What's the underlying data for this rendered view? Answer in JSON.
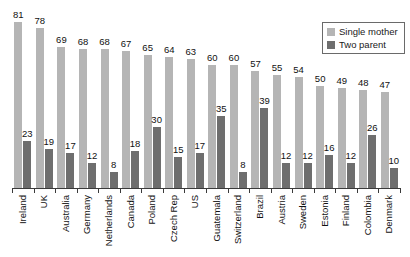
{
  "chart_data": {
    "type": "bar",
    "title": "",
    "subtitle": "",
    "xlabel": "",
    "ylabel": "",
    "ylim": [
      0,
      85
    ],
    "grid": false,
    "legend_position": "top-right",
    "orientation": "vertical",
    "grouping": "grouped",
    "categories": [
      "Ireland",
      "UK",
      "Australia",
      "Germany",
      "Netherlands",
      "Canada",
      "Poland",
      "Czech Rep",
      "US",
      "Guatemala",
      "Switzerland",
      "Brazil",
      "Austria",
      "Sweden",
      "Estonia",
      "Finland",
      "Colombia",
      "Denmark"
    ],
    "series": [
      {
        "name": "Single mother",
        "color": "#b5b5b5",
        "values": [
          81,
          78,
          69,
          68,
          68,
          67,
          65,
          64,
          63,
          60,
          60,
          57,
          55,
          54,
          50,
          49,
          48,
          47
        ]
      },
      {
        "name": "Two parent",
        "color": "#6e6e6e",
        "values": [
          23,
          19,
          17,
          12,
          8,
          18,
          30,
          15,
          17,
          35,
          8,
          39,
          12,
          12,
          16,
          12,
          26,
          10
        ]
      }
    ]
  },
  "legend": {
    "items": [
      {
        "label": "Single mother",
        "swatch": "single"
      },
      {
        "label": "Two parent",
        "swatch": "two"
      }
    ]
  },
  "axis": {
    "baseline_color": "#3a3a3a"
  }
}
